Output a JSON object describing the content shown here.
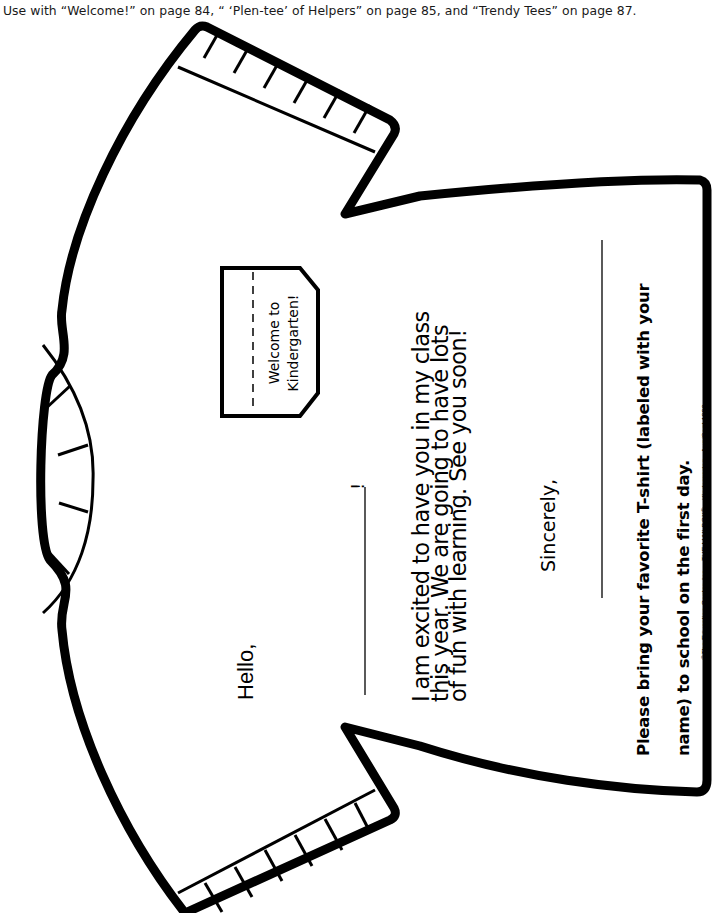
{
  "header_note": "Use with “Welcome!” on page 84, “ ‘Plen-tee’ of Helpers” on page 85, and “Trendy Tees” on page 87.",
  "tag": {
    "line1": "Welcome to",
    "line2": "Kindergarten!"
  },
  "greeting": {
    "salutation": "Hello,",
    "name_blank_end": "!"
  },
  "letter": {
    "line1": "I am excited to have you in my class",
    "line2": "this year. We are going to have lots",
    "line3": "of fun with learning. See you soon!",
    "closing": "Sincerely,"
  },
  "instructions": {
    "line1": "Please bring your favorite T-shirt (labeled with your",
    "line2": "name) to school on the first day."
  },
  "copyright": {
    "prefix": "©The Education Center, Inc. • ",
    "magazine": "THE MAILBOX® • Kindergarten",
    "suffix": " • Aug/Sept 1999"
  },
  "page_number": "88",
  "colors": {
    "ink": "#000000",
    "paper": "#ffffff",
    "header_text": "#1a1a1a"
  }
}
